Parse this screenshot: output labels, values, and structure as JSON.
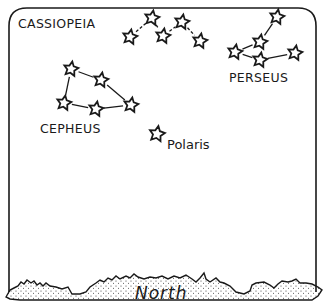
{
  "diagram": {
    "colors": {
      "ink": "#1a1a1a",
      "background": "#ffffff"
    },
    "constellations": [
      {
        "name": "CASSIOPEIA",
        "label_pos": [
          18,
          16
        ],
        "stars": [
          [
            130,
            37
          ],
          [
            152,
            18
          ],
          [
            163,
            36
          ],
          [
            182,
            22
          ],
          [
            200,
            41
          ]
        ],
        "lines": [
          [
            0,
            1
          ],
          [
            1,
            2
          ],
          [
            2,
            3
          ],
          [
            3,
            4
          ]
        ],
        "line_style": "dashed"
      },
      {
        "name": "PERSEUS",
        "label_pos": [
          229,
          70
        ],
        "stars": [
          [
            277,
            17
          ],
          [
            260,
            42
          ],
          [
            235,
            52
          ],
          [
            260,
            60
          ],
          [
            295,
            53
          ]
        ],
        "lines": [
          [
            0,
            1
          ],
          [
            1,
            2
          ],
          [
            2,
            3
          ],
          [
            3,
            4
          ]
        ],
        "line_style": "solid"
      },
      {
        "name": "CEPHEUS",
        "label_pos": [
          40,
          121
        ],
        "stars": [
          [
            71,
            69
          ],
          [
            101,
            80
          ],
          [
            131,
            105
          ],
          [
            96,
            109
          ],
          [
            64,
            103
          ]
        ],
        "lines": [
          [
            0,
            1
          ],
          [
            1,
            2
          ],
          [
            2,
            3
          ],
          [
            3,
            4
          ],
          [
            4,
            0
          ]
        ],
        "line_style": "solid"
      }
    ],
    "polaris": {
      "name": "Polaris",
      "star": [
        157,
        134
      ],
      "label_pos": [
        167,
        137
      ]
    },
    "horizon": {
      "label": "North",
      "label_pos": [
        135,
        285
      ]
    }
  }
}
